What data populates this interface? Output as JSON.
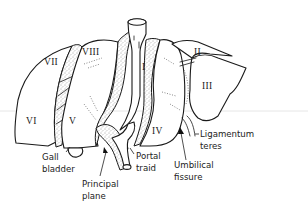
{
  "diagram": {
    "segments": [
      {
        "id": "I",
        "label": "I"
      },
      {
        "id": "II",
        "label": "II"
      },
      {
        "id": "III",
        "label": "III"
      },
      {
        "id": "IV",
        "label": "IV"
      },
      {
        "id": "V",
        "label": "V"
      },
      {
        "id": "VI",
        "label": "VI"
      },
      {
        "id": "VII",
        "label": "VII"
      },
      {
        "id": "VIII",
        "label": "VIII"
      }
    ],
    "annotations": {
      "gall_bladder": {
        "line1": "Gall",
        "line2": "bladder"
      },
      "principal_plane": {
        "line1": "Principal",
        "line2": "plane"
      },
      "portal_triad": {
        "line1": "Portal",
        "line2": "traid"
      },
      "umbilical_fissure": {
        "line1": "Umbilical",
        "line2": "fissure"
      },
      "ligamentum_teres": {
        "line1": "Ligamentum",
        "line2": "teres"
      }
    },
    "colors": {
      "line": "#1a1a1a",
      "background": "#ffffff"
    }
  }
}
